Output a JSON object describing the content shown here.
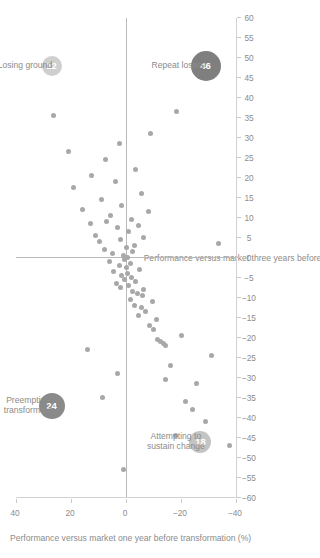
{
  "chart_data": {
    "type": "scatter",
    "title": "",
    "xlabel": "Performance versus market three years before transformation (%)",
    "ylabel": "Performance versus market one year before transformation (%)",
    "xlim": [
      -60,
      60
    ],
    "ylim": [
      -40,
      40
    ],
    "xticks": [
      "-60",
      "-55",
      "-50",
      "-45",
      "-40",
      "-35",
      "-30",
      "-25",
      "-20",
      "-15",
      "-10",
      "-5",
      "0",
      "5",
      "10",
      "15",
      "20",
      "25",
      "30",
      "35",
      "40",
      "45",
      "50",
      "55",
      "60"
    ],
    "yticks": [
      "-40",
      "-20",
      "0",
      "20",
      "40"
    ],
    "grid": false,
    "legend": "none",
    "quadrant_labels": [
      {
        "name": "preemptive-transformers",
        "text": "Preemptive\ntransformers",
        "line1": "Preemptive",
        "line2": "transformers",
        "count": "24",
        "color": "#8a8a8a",
        "quadrant": "top-left"
      },
      {
        "name": "losing-ground",
        "text": "Losing ground",
        "line1": "Losing ground",
        "line2": "",
        "count": "12",
        "color": "#cfcfcf",
        "quadrant": "top-right"
      },
      {
        "name": "attempting-to-sustain-change",
        "text": "Attempting to\nsustain change",
        "line1": "Attempting to",
        "line2": "sustain change",
        "count": "18",
        "color": "#c4c4c4",
        "quadrant": "bottom-left"
      },
      {
        "name": "repeat-losers",
        "text": "Repeat losers",
        "line1": "Repeat losers",
        "line2": "",
        "count": "46",
        "color": "#7f7f7f",
        "quadrant": "bottom-right"
      }
    ],
    "point_color": "#a8a8a8",
    "points": [
      [
        -47.0,
        -37.5
      ],
      [
        -41.0,
        -29.0
      ],
      [
        -38.0,
        -24.0
      ],
      [
        -36.0,
        -21.5
      ],
      [
        -31.5,
        -25.5
      ],
      [
        -30.5,
        -14.5
      ],
      [
        -27.0,
        -16.0
      ],
      [
        -24.5,
        -31.0
      ],
      [
        -23.0,
        14.0
      ],
      [
        -22.0,
        -14.5
      ],
      [
        -21.5,
        -13.5
      ],
      [
        -21.0,
        -12.5
      ],
      [
        -20.5,
        -11.5
      ],
      [
        -19.5,
        -20.0
      ],
      [
        -18.0,
        -10.0
      ],
      [
        -17.0,
        -8.5
      ],
      [
        -15.5,
        -11.0
      ],
      [
        -14.5,
        -4.5
      ],
      [
        -13.5,
        -7.0
      ],
      [
        -12.5,
        -5.5
      ],
      [
        -12.0,
        -3.0
      ],
      [
        -11.0,
        -9.5
      ],
      [
        -10.5,
        -1.5
      ],
      [
        -9.5,
        -6.0
      ],
      [
        -9.0,
        -4.0
      ],
      [
        -8.5,
        -2.5
      ],
      [
        -8.0,
        -6.5
      ],
      [
        -7.5,
        2.0
      ],
      [
        -7.0,
        -1.0
      ],
      [
        -6.5,
        3.5
      ],
      [
        -6.0,
        -3.5
      ],
      [
        -5.5,
        0.5
      ],
      [
        -5.0,
        -2.0
      ],
      [
        -4.5,
        1.5
      ],
      [
        -4.0,
        -0.5
      ],
      [
        -3.5,
        4.5
      ],
      [
        -3.0,
        -5.0
      ],
      [
        -2.5,
        0.0
      ],
      [
        -2.0,
        2.5
      ],
      [
        -1.5,
        -1.5
      ],
      [
        -1.0,
        6.0
      ],
      [
        -0.5,
        0.5
      ],
      [
        0.0,
        -0.5
      ],
      [
        0.5,
        1.0
      ],
      [
        1.0,
        5.0
      ],
      [
        1.5,
        -2.5
      ],
      [
        2.0,
        8.0
      ],
      [
        2.5,
        0.0
      ],
      [
        3.0,
        -3.0
      ],
      [
        4.0,
        9.5
      ],
      [
        4.5,
        2.0
      ],
      [
        5.0,
        -6.5
      ],
      [
        5.5,
        11.0
      ],
      [
        6.5,
        -1.0
      ],
      [
        7.5,
        3.0
      ],
      [
        8.0,
        -4.5
      ],
      [
        8.5,
        13.0
      ],
      [
        9.0,
        7.0
      ],
      [
        9.5,
        -2.0
      ],
      [
        10.5,
        5.5
      ],
      [
        11.5,
        -8.0
      ],
      [
        12.0,
        16.0
      ],
      [
        13.0,
        1.5
      ],
      [
        14.5,
        9.0
      ],
      [
        16.0,
        -5.5
      ],
      [
        17.5,
        19.0
      ],
      [
        19.0,
        4.0
      ],
      [
        20.5,
        12.5
      ],
      [
        22.0,
        -3.5
      ],
      [
        24.5,
        7.5
      ],
      [
        26.5,
        21.0
      ],
      [
        28.5,
        2.5
      ],
      [
        31.0,
        -9.0
      ],
      [
        35.5,
        26.5
      ],
      [
        36.5,
        -18.5
      ],
      [
        3.5,
        -33.5
      ],
      [
        -53.0,
        1.0
      ],
      [
        -44.5,
        -18.0
      ],
      [
        -35.0,
        8.5
      ],
      [
        -29.0,
        3.0
      ]
    ]
  }
}
